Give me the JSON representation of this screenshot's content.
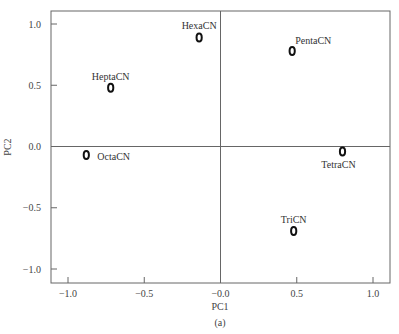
{
  "chart_data": {
    "type": "scatter",
    "title": "",
    "xlabel": "PC1",
    "ylabel": "PC2",
    "caption": "(a)",
    "xlim": [
      -1.12,
      1.1
    ],
    "ylim": [
      -1.12,
      1.1
    ],
    "xticks": [
      -1.0,
      -0.5,
      0.0,
      0.5,
      1.0
    ],
    "xtick_labels": [
      "−1.0",
      "−0.5",
      "−0.0",
      "0.5",
      "1.0"
    ],
    "yticks": [
      1.0,
      0.5,
      0.0,
      -0.5,
      -1.0
    ],
    "ytick_labels": [
      "1.0",
      "0.5",
      "0.0",
      "−0.5",
      "−1.0"
    ],
    "grid": false,
    "reference_lines": {
      "x": 0,
      "y": 0
    },
    "marker": "o",
    "points": [
      {
        "label": "HexaCN",
        "x": -0.14,
        "y": 0.89,
        "label_pos": "above"
      },
      {
        "label": "PentaCN",
        "x": 0.47,
        "y": 0.78,
        "label_pos": "above-right"
      },
      {
        "label": "HeptaCN",
        "x": -0.72,
        "y": 0.48,
        "label_pos": "above"
      },
      {
        "label": "OctaCN",
        "x": -0.88,
        "y": -0.07,
        "label_pos": "right"
      },
      {
        "label": "TetraCN",
        "x": 0.8,
        "y": -0.04,
        "label_pos": "below"
      },
      {
        "label": "TriCN",
        "x": 0.48,
        "y": -0.69,
        "label_pos": "above"
      }
    ]
  }
}
